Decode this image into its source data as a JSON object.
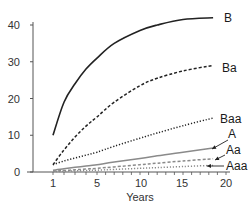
{
  "chart_data": {
    "type": "line",
    "title": "",
    "xlabel": "Years",
    "ylabel": "",
    "xlim": [
      1,
      20
    ],
    "ylim": [
      0,
      40
    ],
    "x_ticks": [
      "1",
      "5",
      "10",
      "15",
      "20"
    ],
    "y_ticks": [
      "0",
      "10",
      "20",
      "30",
      "40"
    ],
    "grid": false,
    "legend_position": "inline-right",
    "x": [
      1,
      2,
      3,
      4,
      5,
      7,
      10,
      12,
      15,
      18.5
    ],
    "series": [
      {
        "name": "B",
        "style": "solid",
        "color": "#222222",
        "values": [
          10,
          19,
          24,
          28,
          31,
          35,
          38.5,
          40,
          41.5,
          42
        ]
      },
      {
        "name": "Ba",
        "style": "dashed",
        "color": "#222222",
        "values": [
          2,
          6,
          9.5,
          12.5,
          15,
          19,
          23.5,
          25.5,
          27.5,
          29
        ]
      },
      {
        "name": "Baa",
        "style": "dotted",
        "color": "#222222",
        "values": [
          2,
          3,
          3.8,
          4.6,
          5.4,
          7,
          9.2,
          10.6,
          12.6,
          14.7
        ]
      },
      {
        "name": "A",
        "style": "solid",
        "color": "#8a8a8a",
        "values": [
          0.5,
          0.9,
          1.3,
          1.6,
          2,
          2.7,
          3.7,
          4.4,
          5.4,
          6.5
        ]
      },
      {
        "name": "Aa",
        "style": "dashed",
        "color": "#8a8a8a",
        "values": [
          0.2,
          0.4,
          0.6,
          0.8,
          1,
          1.4,
          2,
          2.4,
          3,
          3.6
        ]
      },
      {
        "name": "Aaa",
        "style": "dotted",
        "color": "#8a8a8a",
        "values": [
          0.1,
          0.2,
          0.3,
          0.4,
          0.5,
          0.7,
          1,
          1.2,
          1.5,
          1.8
        ]
      }
    ]
  }
}
